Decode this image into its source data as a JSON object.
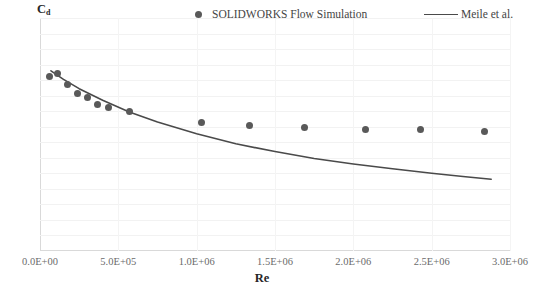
{
  "chart_data": {
    "type": "scatter",
    "title": "",
    "xlabel": "Re",
    "ylabel": "Cd",
    "ylabel_base": "C",
    "ylabel_sub": "d",
    "xlim": [
      0,
      3000000
    ],
    "ylim": [
      0.25,
      0.4
    ],
    "grid": true,
    "legend_position": "top",
    "xticks": [
      0,
      500000,
      1000000,
      1500000,
      2000000,
      2500000,
      3000000
    ],
    "xtick_labels": [
      "0.0E+00",
      "5.0E+05",
      "1.0E+06",
      "1.5E+06",
      "2.0E+06",
      "2.5E+06",
      "3.0E+06"
    ],
    "yticks": [
      0.25,
      0.26,
      0.27,
      0.28,
      0.29,
      0.3,
      0.31,
      0.32,
      0.33,
      0.34,
      0.35,
      0.36,
      0.37,
      0.38,
      0.39,
      0.4
    ],
    "ytick_labels": [
      "0.25",
      "0.26",
      "0.27",
      "0.28",
      "0.29",
      "0.3",
      "0.31",
      "0.32",
      "0.33",
      "0.34",
      "0.35",
      "0.36",
      "0.37",
      "0.38",
      "0.39",
      "0.4"
    ],
    "series": [
      {
        "name": "SOLIDWORKS Flow Simulation",
        "type": "scatter",
        "marker": "circle",
        "color": "#595959",
        "points": [
          {
            "x": 60000,
            "y": 0.3625
          },
          {
            "x": 110000,
            "y": 0.3645
          },
          {
            "x": 175000,
            "y": 0.3575
          },
          {
            "x": 240000,
            "y": 0.3515
          },
          {
            "x": 300000,
            "y": 0.349
          },
          {
            "x": 370000,
            "y": 0.344
          },
          {
            "x": 440000,
            "y": 0.3425
          },
          {
            "x": 570000,
            "y": 0.3395
          },
          {
            "x": 1030000,
            "y": 0.333
          },
          {
            "x": 1340000,
            "y": 0.3305
          },
          {
            "x": 1690000,
            "y": 0.3295
          },
          {
            "x": 2080000,
            "y": 0.3285
          },
          {
            "x": 2430000,
            "y": 0.328
          },
          {
            "x": 2840000,
            "y": 0.327
          }
        ]
      },
      {
        "name": "Meile et al.",
        "type": "line",
        "color": "#4a4a4a",
        "points": [
          {
            "x": 70000,
            "y": 0.366
          },
          {
            "x": 150000,
            "y": 0.3605
          },
          {
            "x": 250000,
            "y": 0.3545
          },
          {
            "x": 400000,
            "y": 0.347
          },
          {
            "x": 570000,
            "y": 0.3395
          },
          {
            "x": 750000,
            "y": 0.333
          },
          {
            "x": 1000000,
            "y": 0.3255
          },
          {
            "x": 1250000,
            "y": 0.319
          },
          {
            "x": 1500000,
            "y": 0.314
          },
          {
            "x": 1750000,
            "y": 0.3095
          },
          {
            "x": 2000000,
            "y": 0.306
          },
          {
            "x": 2250000,
            "y": 0.303
          },
          {
            "x": 2500000,
            "y": 0.3
          },
          {
            "x": 2700000,
            "y": 0.298
          },
          {
            "x": 2880000,
            "y": 0.2962
          }
        ]
      }
    ]
  },
  "legend": {
    "entries": [
      {
        "label": "SOLIDWORKS Flow Simulation",
        "marker": "circle"
      },
      {
        "label": "Meile et al.",
        "marker": "line"
      }
    ]
  },
  "caption": {
    "text": ""
  },
  "colors": {
    "marker": "#595959",
    "line": "#4a4a4a",
    "grid": "#f2f2f2",
    "axis": "#d9d9d9",
    "tick_text": "#6b6b6b"
  }
}
